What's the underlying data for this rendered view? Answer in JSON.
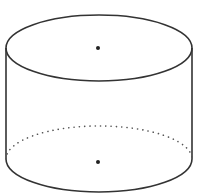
{
  "diagram": {
    "title": "",
    "shape": "cylinder",
    "colors": {
      "background": "#ffffff",
      "stroke": "#333333",
      "dot": "#222222",
      "hidden_edge": "#555555"
    },
    "top_ellipse": {
      "cx": 99,
      "cy": 48,
      "rx": 93,
      "ry": 33
    },
    "bottom_ellipse": {
      "cx": 99,
      "cy": 159,
      "rx": 93,
      "ry": 33
    },
    "top_center_dot": {
      "cx": 98,
      "cy": 48,
      "r": 2
    },
    "bottom_center_dot": {
      "cx": 98,
      "cy": 162,
      "r": 2
    },
    "labels": []
  }
}
